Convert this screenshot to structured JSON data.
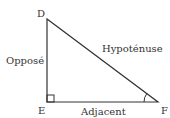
{
  "diagram": {
    "type": "right-triangle",
    "colors": {
      "stroke": "#333333",
      "text": "#333333",
      "background": "#ffffff"
    },
    "vertices": {
      "D": {
        "label": "D",
        "x": 47,
        "y": 19
      },
      "E": {
        "label": "E",
        "x": 47,
        "y": 102
      },
      "F": {
        "label": "F",
        "x": 158,
        "y": 102
      }
    },
    "sides": {
      "opposite": "Opposé",
      "hypotenuse": "Hypoténuse",
      "adjacent": "Adjacent"
    },
    "right_angle_at": "E",
    "marked_angle_at": "F"
  }
}
